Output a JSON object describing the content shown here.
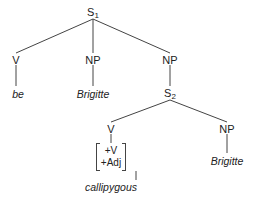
{
  "diagram": {
    "type": "syntax-tree",
    "nodes": {
      "s1": {
        "label": "S",
        "sub": "1"
      },
      "v1": {
        "label": "V"
      },
      "np1": {
        "label": "NP"
      },
      "np2": {
        "label": "NP"
      },
      "be": {
        "label": "be"
      },
      "brigitte1": {
        "label": "Brigitte"
      },
      "s2": {
        "label": "S",
        "sub": "2"
      },
      "v2": {
        "label": "V"
      },
      "np3": {
        "label": "NP"
      },
      "features": [
        "+V",
        "+Adj"
      ],
      "callipygous": {
        "label": "callipygous"
      },
      "brigitte2": {
        "label": "Brigitte"
      }
    }
  }
}
